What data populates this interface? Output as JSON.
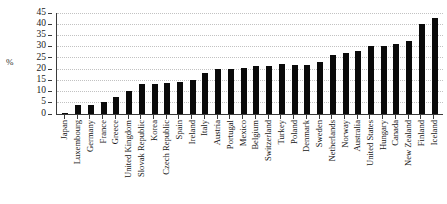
{
  "chart_data": {
    "type": "bar",
    "title": "",
    "xlabel": "",
    "ylabel": "%",
    "ylim": [
      0,
      45
    ],
    "ytick_step": 5,
    "yticks": [
      45,
      40,
      35,
      30,
      25,
      20,
      15,
      10,
      5,
      0
    ],
    "grid": true,
    "legend": "none",
    "bar_color": "#0a0a0a",
    "categories": [
      "Japan",
      "Luxembourg",
      "Germany",
      "France",
      "Greece",
      "United Kingdom",
      "Slovak Republic",
      "Korea",
      "Czech Republic",
      "Spain",
      "Ireland",
      "Italy",
      "Austria",
      "Portugal",
      "Mexico",
      "Belgium",
      "Switzerland",
      "Turkey",
      "Poland",
      "Denmark",
      "Sweden",
      "Netherlands",
      "Norway",
      "Australia",
      "United States",
      "Hungary",
      "Canada",
      "New Zealand",
      "Finland",
      "Iceland"
    ],
    "values": [
      0.4,
      4.0,
      4.0,
      5.0,
      7.5,
      10.0,
      13.0,
      13.0,
      13.5,
      14.0,
      15.0,
      18.0,
      20.0,
      20.0,
      20.5,
      21.0,
      21.0,
      22.0,
      21.5,
      21.5,
      23.0,
      26.0,
      27.0,
      28.0,
      30.0,
      30.0,
      31.0,
      32.5,
      40.0,
      42.5
    ]
  },
  "axes": {
    "y_axis_title": "%"
  }
}
